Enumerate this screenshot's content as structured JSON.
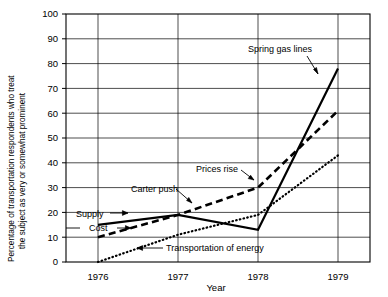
{
  "chart_data": {
    "type": "line",
    "title": "",
    "xlabel": "Year",
    "ylabel": "Percentage of transportation respondents who treat the subject as very or somewhat prominent",
    "x": [
      1976,
      1977,
      1978,
      1979
    ],
    "xticklabels": [
      "1976",
      "1977",
      "1978",
      "1979"
    ],
    "xlim": [
      1975.6,
      1979.4
    ],
    "ylim": [
      0,
      100
    ],
    "yticks": [
      0,
      10,
      20,
      30,
      40,
      50,
      60,
      70,
      80,
      90,
      100
    ],
    "yticklabels": [
      "0",
      "10",
      "20",
      "30",
      "40",
      "50",
      "60",
      "70",
      "80",
      "90",
      "100"
    ],
    "grid": "both",
    "legend": "none",
    "series": [
      {
        "name": "Supply",
        "style": "solid",
        "values": [
          15,
          19,
          13,
          78
        ]
      },
      {
        "name": "Cost",
        "style": "dashed",
        "values": [
          10,
          19,
          30,
          61
        ]
      },
      {
        "name": "Transportation of energy",
        "style": "dotted",
        "values": [
          0,
          11,
          19,
          43
        ]
      }
    ],
    "annotations": [
      {
        "id": "spring-gas-lines",
        "text": "Spring gas lines",
        "points_to_series": "Supply",
        "near_x": 1979,
        "near_y": 79
      },
      {
        "id": "prices-rise",
        "text": "Prices rise",
        "points_to_series": "Cost",
        "near_x": 1978,
        "near_y": 30
      },
      {
        "id": "carter-push",
        "text": "Carter push",
        "points_to_series": "Supply",
        "near_x": 1977,
        "near_y": 19
      },
      {
        "id": "supply",
        "text": "Supply",
        "points_to_series": "Supply",
        "near_x": 1976,
        "near_y": 15
      },
      {
        "id": "cost",
        "text": "Cost",
        "points_to_series": "Cost",
        "near_x": 1976,
        "near_y": 10
      },
      {
        "id": "transportation-of-energy",
        "text": "Transportation of energy",
        "points_to_series": "Transportation of energy",
        "near_x": 1976.3,
        "near_y": 4
      }
    ]
  },
  "axes": {
    "y_axis_label_line1": "Percentage of transportation respondents who treat",
    "y_axis_label_line2": "the subject as very or somewhat prominent",
    "x_axis_label": "Year"
  }
}
